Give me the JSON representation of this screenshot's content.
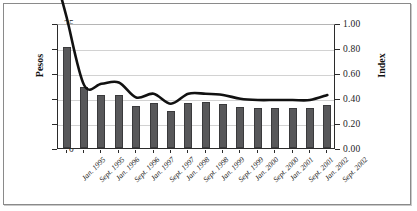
{
  "chart_data": {
    "type": "bar",
    "title": "",
    "subtitle": "",
    "xlabel": "",
    "ylabel": "Pesos",
    "ylabel_secondary": "Index",
    "grid": true,
    "legend": "none",
    "categories": [
      "Jan. 1995",
      "Sept. 1995",
      "Jan. 1996",
      "Sept. 1996",
      "Jan. 1997",
      "Sept. 1997",
      "Jan. 1998",
      "Sept. 1998",
      "Jan. 1999",
      "Sept. 1999",
      "Jan. 2000",
      "Sept. 2000",
      "Jan. 2001",
      "Sept. 2001",
      "Jan. 2002",
      "Sept. 2002"
    ],
    "ylim": [
      0,
      25
    ],
    "ylim_secondary": [
      0.0,
      1.0
    ],
    "yticks": [
      "0",
      "5",
      "10",
      "15",
      "20",
      "25"
    ],
    "yticks_secondary": [
      "0.00",
      "0.20",
      "0.40",
      "0.60",
      "0.80",
      "1.00"
    ],
    "series": [
      {
        "name": "Pesos",
        "type": "bar",
        "axis": "left",
        "color": "#58585a",
        "values": [
          20.3,
          12.3,
          10.7,
          10.7,
          8.5,
          9.1,
          7.5,
          9.1,
          9.3,
          8.9,
          8.2,
          8.0,
          8.0,
          8.0,
          8.0,
          8.7
        ]
      },
      {
        "name": "Index",
        "type": "line",
        "axis": "right",
        "color": "#111111",
        "values": [
          1.06,
          0.52,
          0.53,
          0.54,
          0.42,
          0.45,
          0.37,
          0.45,
          0.45,
          0.44,
          0.41,
          0.4,
          0.4,
          0.4,
          0.4,
          0.44
        ]
      }
    ]
  }
}
